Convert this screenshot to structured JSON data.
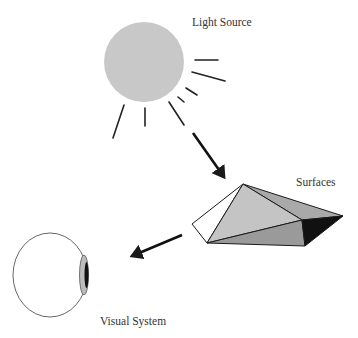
{
  "labels": {
    "light_source": "Light Source",
    "surfaces": "Surfaces",
    "visual_system": "Visual System"
  },
  "colors": {
    "sun_fill": "#c8c8c8",
    "stroke": "#1a1a1a",
    "face_light": "#c4c4c4",
    "face_mid": "#a9a9a9",
    "face_dark": "#9a9a9a",
    "face_black": "#111111",
    "face_white": "#ffffff",
    "lens_fill": "#bcbcbc",
    "eye_stroke": "#555555"
  }
}
